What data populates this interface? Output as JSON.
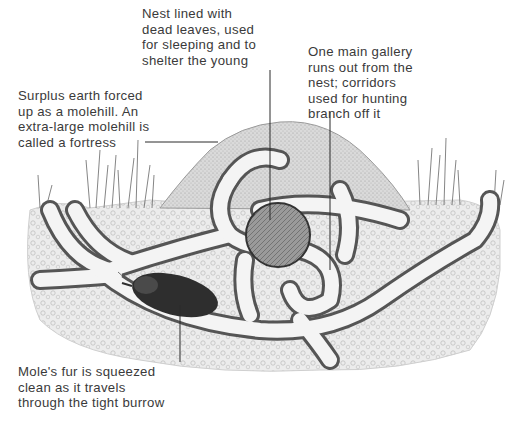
{
  "diagram": {
    "labels": {
      "nest": "Nest lined with\ndead leaves, used\nfor sleeping and to\nshelter the young",
      "gallery": "One main gallery\nruns out from the\nnest; corridors\nused for hunting\nbranch off it",
      "surplus": "Surplus earth forced\nup as a molehill. An\nextra-large molehill is\ncalled a fortress",
      "fur": "Mole's fur is squeezed\nclean as it travels\nthrough the tight burrow"
    },
    "parts": [
      "molehill",
      "nest",
      "main-gallery",
      "hunting-corridors",
      "mole",
      "grass",
      "soil"
    ],
    "colors": {
      "text": "#3a3a3a",
      "line": "#2a2a2a",
      "soil": "#e4e4e4",
      "mound": "#d2d2d2",
      "tunnel": "#f4f4f4",
      "tunnel_edge": "#555555",
      "nest": "#8a8a8a",
      "mole": "#2e2e2e"
    }
  }
}
